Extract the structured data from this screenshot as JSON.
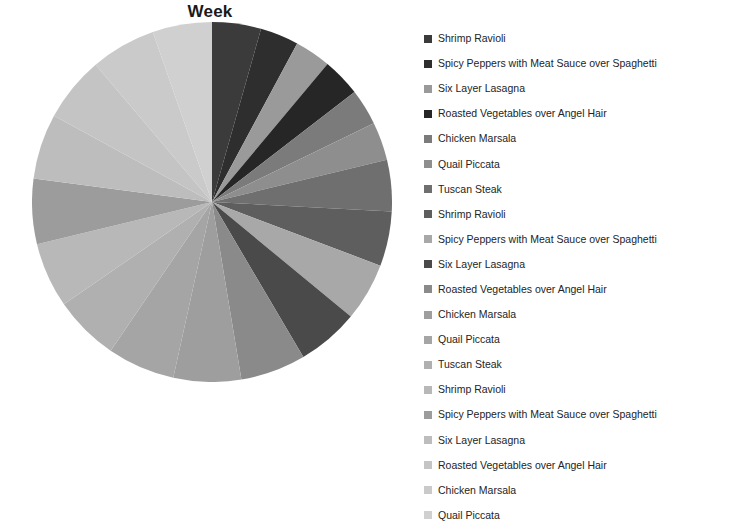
{
  "chart": {
    "title": "Week"
  },
  "chart_data": {
    "type": "pie",
    "title": "Week",
    "xlabel": "",
    "ylabel": "",
    "grid": false,
    "legend_position": "right",
    "start_angle_deg": 0,
    "direction": "clockwise",
    "categories": [
      "Shrimp Ravioli",
      "Spicy Peppers with Meat Sauce over  Spaghetti",
      "Six Layer Lasagna",
      "Roasted Vegetables over Angel Hair",
      "Chicken Marsala",
      "Quail Piccata",
      "Tuscan Steak",
      "Shrimp Ravioli",
      "Spicy Peppers with Meat Sauce over  Spaghetti",
      "Six Layer Lasagna",
      "Roasted Vegetables over Angel Hair",
      "Chicken Marsala",
      "Quail Piccata",
      "Tuscan Steak",
      "Shrimp Ravioli",
      "Spicy Peppers with Meat Sauce over  Spaghetti",
      "Six Layer Lasagna",
      "Roasted Vegetables over Angel Hair",
      "Chicken Marsala",
      "Quail Piccata"
    ],
    "values": [
      4.2,
      3.3,
      3.1,
      3.3,
      3.1,
      3.3,
      4.4,
      4.7,
      5.0,
      5.3,
      5.6,
      5.8,
      5.8,
      5.6,
      5.6,
      5.6,
      5.6,
      5.6,
      5.6,
      5.1
    ],
    "colors": [
      "#3b3b3b",
      "#2e2e2e",
      "#9a9a9a",
      "#262626",
      "#7b7b7b",
      "#8e8e8e",
      "#6f6f6f",
      "#5e5e5e",
      "#a8a8a8",
      "#4a4a4a",
      "#8a8a8a",
      "#9e9e9e",
      "#a5a5a5",
      "#b0b0b0",
      "#b8b8b8",
      "#9c9c9c",
      "#bdbdbd",
      "#c4c4c4",
      "#cacaca",
      "#d0d0d0"
    ]
  },
  "legend": {
    "items": [
      {
        "label": "Shrimp Ravioli",
        "color": "#3b3b3b"
      },
      {
        "label": "Spicy Peppers with Meat Sauce over  Spaghetti",
        "color": "#2e2e2e"
      },
      {
        "label": "Six Layer Lasagna",
        "color": "#9a9a9a"
      },
      {
        "label": "Roasted Vegetables over Angel Hair",
        "color": "#262626"
      },
      {
        "label": "Chicken Marsala",
        "color": "#7b7b7b"
      },
      {
        "label": "Quail Piccata",
        "color": "#8e8e8e"
      },
      {
        "label": "Tuscan Steak",
        "color": "#6f6f6f"
      },
      {
        "label": "Shrimp Ravioli",
        "color": "#5e5e5e"
      },
      {
        "label": "Spicy Peppers with Meat Sauce over  Spaghetti",
        "color": "#a8a8a8"
      },
      {
        "label": "Six Layer Lasagna",
        "color": "#4a4a4a"
      },
      {
        "label": "Roasted Vegetables over Angel Hair",
        "color": "#8a8a8a"
      },
      {
        "label": "Chicken Marsala",
        "color": "#9e9e9e"
      },
      {
        "label": "Quail Piccata",
        "color": "#a5a5a5"
      },
      {
        "label": "Tuscan Steak",
        "color": "#b0b0b0"
      },
      {
        "label": "Shrimp Ravioli",
        "color": "#b8b8b8"
      },
      {
        "label": "Spicy Peppers with Meat Sauce over  Spaghetti",
        "color": "#9c9c9c"
      },
      {
        "label": "Six Layer Lasagna",
        "color": "#bdbdbd"
      },
      {
        "label": "Roasted Vegetables over Angel Hair",
        "color": "#c4c4c4"
      },
      {
        "label": "Chicken Marsala",
        "color": "#cacaca"
      },
      {
        "label": "Quail Piccata",
        "color": "#d0d0d0"
      }
    ]
  }
}
